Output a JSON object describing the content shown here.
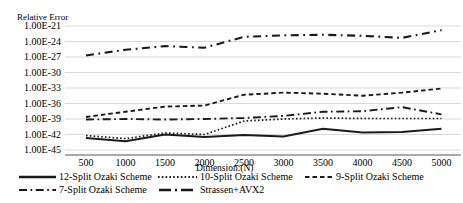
{
  "chart_data": {
    "type": "line",
    "title": "",
    "ylabel": "Relative Error",
    "xlabel": "Dimension:(N)",
    "x": [
      500,
      1000,
      1500,
      2000,
      2500,
      3000,
      3500,
      4000,
      4500,
      5000
    ],
    "x_tick_labels": [
      "500",
      "1000",
      "1500",
      "2000",
      "2500",
      "3000",
      "3500",
      "4000",
      "4500",
      "5000"
    ],
    "y_axis": {
      "scale": "log10",
      "top": "1.00E-21",
      "bottom": "1.00E-45",
      "tick_labels": [
        "1.00E-21",
        "1.00E-24",
        "1.00E-27",
        "1.00E-30",
        "1.00E-33",
        "1.00E-36",
        "1.00E-39",
        "1.00E-42",
        "1.00E-45"
      ],
      "tick_exponents": [
        -21,
        -24,
        -27,
        -30,
        -33,
        -36,
        -39,
        -42,
        -45
      ],
      "grid": true
    },
    "series": [
      {
        "name": "12-Split Ozaki Scheme",
        "style": "solid",
        "log10_relative_error": [
          -42.7,
          -43.3,
          -42.0,
          -42.5,
          -42.1,
          -42.4,
          -40.9,
          -41.6,
          -41.5,
          -40.9
        ]
      },
      {
        "name": "10-Split Ozaki Scheme",
        "style": "dotted",
        "log10_relative_error": [
          -42.2,
          -42.8,
          -41.7,
          -42.0,
          -39.4,
          -39.0,
          -38.8,
          -38.9,
          -38.9,
          -38.9
        ]
      },
      {
        "name": "9-Split Ozaki Scheme",
        "style": "dashed",
        "log10_relative_error": [
          -38.6,
          -37.6,
          -36.6,
          -36.4,
          -34.3,
          -33.9,
          -34.1,
          -34.5,
          -33.9,
          -33.1
        ]
      },
      {
        "name": "7-Split Ozaki Scheme",
        "style": "dash-dot",
        "log10_relative_error": [
          -39.1,
          -39.0,
          -39.1,
          -39.0,
          -38.8,
          -38.4,
          -37.6,
          -37.5,
          -36.7,
          -38.1
        ]
      },
      {
        "name": "Strassen+AVX2",
        "style": "long-dash-dot",
        "log10_relative_error": [
          -26.7,
          -25.6,
          -24.9,
          -25.2,
          -23.1,
          -22.8,
          -22.7,
          -22.9,
          -23.3,
          -21.8
        ]
      }
    ],
    "legend": {
      "position": "bottom",
      "rows": [
        [
          "12-Split Ozaki Scheme",
          "10-Split Ozaki Scheme",
          "9-Split Ozaki Scheme"
        ],
        [
          "7-Split Ozaki Scheme",
          "Strassen+AVX2"
        ]
      ]
    },
    "colors": {
      "line": "#1a1a1a",
      "grid": "#d9d9d9",
      "axis_line": "#595959",
      "text": "#000000",
      "background": "#ffffff"
    }
  }
}
